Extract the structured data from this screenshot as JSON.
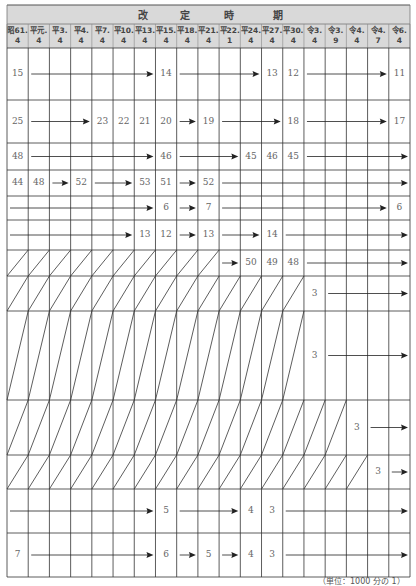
{
  "table": {
    "title_chars": [
      "改",
      "定",
      "時",
      "期"
    ],
    "columns": [
      {
        "era": "昭61.",
        "month": "4"
      },
      {
        "era": "平元.",
        "month": "4"
      },
      {
        "era": "平3.",
        "month": "4"
      },
      {
        "era": "平4.",
        "month": "4"
      },
      {
        "era": "平7.",
        "month": "4"
      },
      {
        "era": "平10.",
        "month": "4"
      },
      {
        "era": "平13.",
        "month": "4"
      },
      {
        "era": "平15.",
        "month": "4"
      },
      {
        "era": "平18.",
        "month": "4"
      },
      {
        "era": "平21.",
        "month": "4"
      },
      {
        "era": "平22.",
        "month": "1"
      },
      {
        "era": "平24.",
        "month": "4"
      },
      {
        "era": "平27.",
        "month": "4"
      },
      {
        "era": "平30.",
        "month": "4"
      },
      {
        "era": "令3.",
        "month": "4"
      },
      {
        "era": "令3.",
        "month": "9"
      },
      {
        "era": "令4.",
        "month": "4"
      },
      {
        "era": "令4.",
        "month": "7"
      },
      {
        "era": "令6.",
        "month": "4"
      }
    ],
    "rows": [
      {
        "values": [
          {
            "col": 0,
            "v": "15"
          },
          {
            "col": 7,
            "v": "14"
          },
          {
            "col": 12,
            "v": "13"
          },
          {
            "col": 13,
            "v": "12"
          },
          {
            "col": 18,
            "v": "11"
          }
        ]
      },
      {
        "values": [
          {
            "col": 0,
            "v": "25"
          },
          {
            "col": 4,
            "v": "23"
          },
          {
            "col": 5,
            "v": "22"
          },
          {
            "col": 6,
            "v": "21"
          },
          {
            "col": 7,
            "v": "20"
          },
          {
            "col": 9,
            "v": "19"
          },
          {
            "col": 13,
            "v": "18"
          },
          {
            "col": 18,
            "v": "17"
          }
        ]
      },
      {
        "values": [
          {
            "col": 0,
            "v": "48"
          },
          {
            "col": 7,
            "v": "46"
          },
          {
            "col": 11,
            "v": "45"
          },
          {
            "col": 12,
            "v": "46"
          },
          {
            "col": 13,
            "v": "45"
          }
        ]
      },
      {
        "values": [
          {
            "col": 0,
            "v": "44"
          },
          {
            "col": 1,
            "v": "48"
          },
          {
            "col": 3,
            "v": "52"
          },
          {
            "col": 6,
            "v": "53"
          },
          {
            "col": 7,
            "v": "51"
          },
          {
            "col": 9,
            "v": "52"
          }
        ]
      },
      {
        "values": [
          {
            "col": 7,
            "v": "6"
          },
          {
            "col": 9,
            "v": "7"
          },
          {
            "col": 18,
            "v": "6"
          }
        ]
      },
      {
        "values": [
          {
            "col": 6,
            "v": "13"
          },
          {
            "col": 7,
            "v": "12"
          },
          {
            "col": 9,
            "v": "13"
          },
          {
            "col": 12,
            "v": "14"
          }
        ]
      },
      {
        "values": [
          {
            "col": 11,
            "v": "50"
          },
          {
            "col": 12,
            "v": "49"
          },
          {
            "col": 13,
            "v": "48"
          }
        ]
      },
      {
        "values": [
          {
            "col": 14,
            "v": "3"
          }
        ]
      },
      {
        "values": [
          {
            "col": 14,
            "v": "3"
          }
        ]
      },
      {
        "values": [
          {
            "col": 16,
            "v": "3"
          }
        ]
      },
      {
        "values": [
          {
            "col": 17,
            "v": "3"
          }
        ]
      },
      {
        "values": [
          {
            "col": 7,
            "v": "5"
          },
          {
            "col": 11,
            "v": "4"
          },
          {
            "col": 12,
            "v": "3"
          }
        ]
      },
      {
        "values": [
          {
            "col": 0,
            "v": "7"
          },
          {
            "col": 7,
            "v": "6"
          },
          {
            "col": 9,
            "v": "5"
          },
          {
            "col": 11,
            "v": "4"
          },
          {
            "col": 12,
            "v": "3"
          }
        ]
      }
    ]
  },
  "footer": "（単位：1000 分の 1）"
}
